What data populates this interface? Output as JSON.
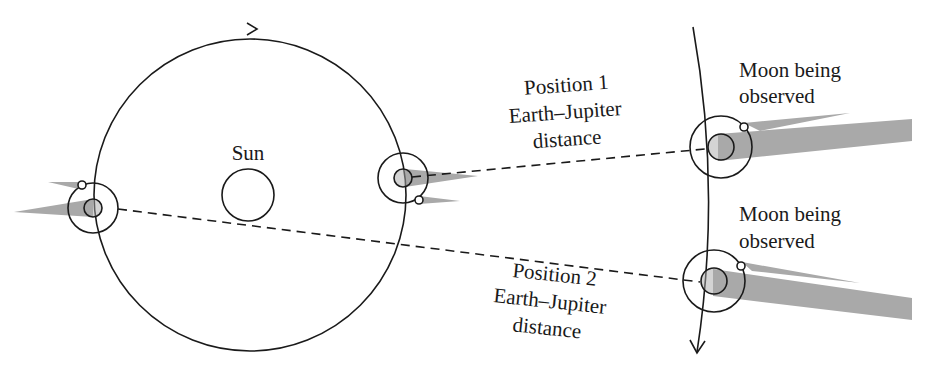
{
  "diagram": {
    "labels": {
      "sun": "Sun",
      "position1": [
        "Position 1",
        "Earth–Jupiter",
        "distance"
      ],
      "position2": [
        "Position 2",
        "Earth–Jupiter",
        "distance"
      ],
      "moon_upper": [
        "Moon being",
        "observed"
      ],
      "moon_lower": [
        "Moon being",
        "observed"
      ]
    },
    "elements": {
      "earth_orbit": {
        "shape": "circle",
        "direction": "clockwise-arrow"
      },
      "jupiter_orbit": {
        "shape": "arc",
        "direction": "downward-arrow"
      },
      "earth_positions": [
        "left (Position 2)",
        "right (Position 1)"
      ],
      "jupiter_positions": [
        "upper (Position 1)",
        "lower (Position 2)"
      ],
      "shadow_color": "#a9a9a9",
      "line_color": "#1a1a1a"
    }
  }
}
